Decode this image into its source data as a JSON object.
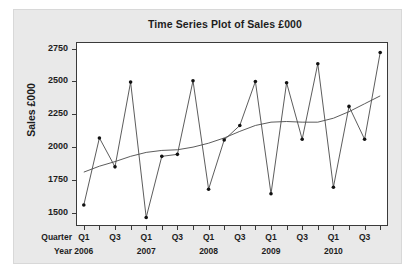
{
  "chart_data": {
    "type": "line",
    "title": "Time Series Plot of Sales £000",
    "xlabel": "",
    "ylabel": "Sales £000",
    "ylim": [
      1400,
      2800
    ],
    "yticks": [
      1500,
      1750,
      2000,
      2250,
      2500,
      2750
    ],
    "grid": false,
    "legend": false,
    "axis_row_captions": {
      "quarter": "Quarter",
      "year": "Year"
    },
    "x_quarter_ticks": [
      "Q1",
      "",
      "Q3",
      "",
      "Q1",
      "",
      "Q3",
      "",
      "Q1",
      "",
      "Q3",
      "",
      "Q1",
      "",
      "Q3",
      "",
      "Q1",
      "",
      "Q3",
      ""
    ],
    "x_year_ticks": [
      "2006",
      "2007",
      "2008",
      "2009",
      "2010"
    ],
    "categories": [
      "2006 Q1",
      "2006 Q2",
      "2006 Q3",
      "2006 Q4",
      "2007 Q1",
      "2007 Q2",
      "2007 Q3",
      "2007 Q4",
      "2008 Q1",
      "2008 Q2",
      "2008 Q3",
      "2008 Q4",
      "2009 Q1",
      "2009 Q2",
      "2009 Q3",
      "2009 Q4",
      "2010 Q1",
      "2010 Q2",
      "2010 Q3",
      "2010 Q4"
    ],
    "series": [
      {
        "name": "Sales £000",
        "type": "line-markers",
        "values": [
          1560,
          2070,
          1850,
          2495,
          1465,
          1930,
          1945,
          2505,
          1680,
          2055,
          2165,
          2500,
          1645,
          2490,
          2060,
          2635,
          1695,
          2310,
          2060,
          2720
        ]
      },
      {
        "name": "Trend",
        "type": "line-smooth",
        "values": [
          1810,
          1855,
          1890,
          1930,
          1960,
          1975,
          1980,
          2000,
          2030,
          2070,
          2120,
          2165,
          2190,
          2195,
          2190,
          2190,
          2220,
          2270,
          2330,
          2390
        ]
      }
    ],
    "colors": {
      "data_line": "#4a4a4a",
      "trend_line": "#4a4a4a",
      "marker": "#111111",
      "frame": "#3a3a3a",
      "panel_background": "#e9e9e9",
      "plot_background": "#ffffff",
      "text": "#1d1d1d"
    }
  }
}
